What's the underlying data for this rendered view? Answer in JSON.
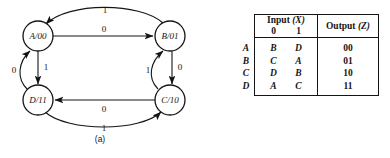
{
  "figure": {
    "panel_a": {
      "caption": "(a)",
      "type": "state-transition-diagram",
      "nodes": [
        {
          "id": "A",
          "label": "A/00",
          "state": "A",
          "output": "00",
          "cx": 38,
          "cy": 36
        },
        {
          "id": "B",
          "label": "B/01",
          "state": "B",
          "output": "01",
          "cx": 170,
          "cy": 36
        },
        {
          "id": "C",
          "label": "C/10",
          "state": "C",
          "output": "10",
          "cx": 170,
          "cy": 100
        },
        {
          "id": "D",
          "label": "D/11",
          "state": "D",
          "output": "11",
          "cx": 38,
          "cy": 100
        }
      ],
      "edges": [
        {
          "from": "A",
          "to": "B",
          "label": "0",
          "shape": "straight",
          "side": "top"
        },
        {
          "from": "B",
          "to": "A",
          "label": "1",
          "shape": "curve",
          "side": "top-arc"
        },
        {
          "from": "B",
          "to": "C",
          "label": "0",
          "shape": "straight",
          "side": "right"
        },
        {
          "from": "C",
          "to": "B",
          "label": "1",
          "shape": "curve",
          "side": "right-arc"
        },
        {
          "from": "C",
          "to": "D",
          "label": "0",
          "shape": "straight",
          "side": "bottom"
        },
        {
          "from": "D",
          "to": "C",
          "label": "1",
          "shape": "curve",
          "side": "bottom-arc"
        },
        {
          "from": "A",
          "to": "D",
          "label": "1",
          "shape": "straight",
          "side": "left"
        },
        {
          "from": "D",
          "to": "A",
          "label": "0",
          "shape": "curve",
          "side": "left-arc"
        }
      ]
    },
    "panel_b": {
      "caption": "(b)",
      "type": "state-table",
      "header": {
        "input_title": "Input",
        "input_var": "(X)",
        "input_bits": [
          "0",
          "1"
        ],
        "output_title": "Output",
        "output_var": "(Z)"
      },
      "rows": [
        {
          "present_state": "A",
          "next_on_0": "B",
          "next_on_1": "D",
          "output": "00"
        },
        {
          "present_state": "B",
          "next_on_0": "C",
          "next_on_1": "A",
          "output": "01"
        },
        {
          "present_state": "C",
          "next_on_0": "D",
          "next_on_1": "B",
          "output": "10"
        },
        {
          "present_state": "D",
          "next_on_0": "A",
          "next_on_1": "C",
          "output": "11"
        }
      ]
    }
  },
  "colors": {
    "ink": "#141414",
    "paper": "#ffffff"
  }
}
